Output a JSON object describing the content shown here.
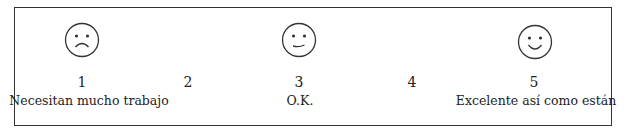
{
  "scale": {
    "points": [
      {
        "value": "1",
        "face": "sad-face-icon",
        "label": "Necesitan mucho trabajo"
      },
      {
        "value": "2"
      },
      {
        "value": "3",
        "face": "neutral-face-icon",
        "label": "O.K."
      },
      {
        "value": "4"
      },
      {
        "value": "5",
        "face": "happy-face-icon",
        "label": "Excelente así como están"
      }
    ]
  }
}
